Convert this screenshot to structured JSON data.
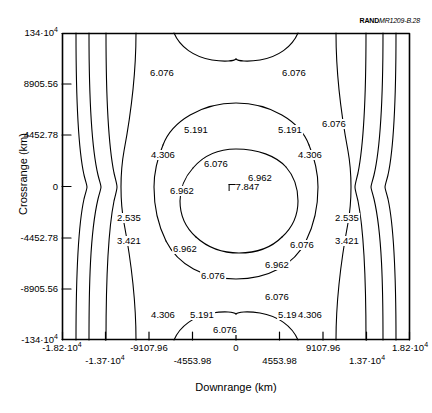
{
  "credit": {
    "publisher": "RAND",
    "document_id": "MR1209-B.28"
  },
  "axes": {
    "xlabel": "Downrange (km)",
    "ylabel": "Crossrange (km)"
  },
  "chart_data": {
    "type": "contour",
    "title": "",
    "xlabel": "Downrange (km)",
    "ylabel": "Crossrange (km)",
    "xlim": [
      -18200,
      18200
    ],
    "ylim": [
      -13400,
      13400
    ],
    "grid": false,
    "legend": "none",
    "xticks": [
      {
        "value": -18200,
        "label": "-1.82·10",
        "exp": "4",
        "row": "a"
      },
      {
        "value": -13700,
        "label": "-1.37·10",
        "exp": "4",
        "row": "b"
      },
      {
        "value": -9107.96,
        "label": "-9107.96",
        "exp": "",
        "row": "a"
      },
      {
        "value": -4553.98,
        "label": "-4553.98",
        "exp": "",
        "row": "b"
      },
      {
        "value": 0,
        "label": "0",
        "exp": "",
        "row": "a"
      },
      {
        "value": 4553.98,
        "label": "4553.98",
        "exp": "",
        "row": "b"
      },
      {
        "value": 9107.96,
        "label": "9107.96",
        "exp": "",
        "row": "a"
      },
      {
        "value": 13700,
        "label": "1.37·10",
        "exp": "4",
        "row": "b"
      },
      {
        "value": 18200,
        "label": "1.82·10",
        "exp": "4",
        "row": "a"
      }
    ],
    "yticks": [
      {
        "value": 13400,
        "label": "134·10",
        "exp": "4"
      },
      {
        "value": 8905.56,
        "label": "8905.56",
        "exp": ""
      },
      {
        "value": 4452.78,
        "label": "4452.78",
        "exp": ""
      },
      {
        "value": 0,
        "label": "0",
        "exp": ""
      },
      {
        "value": -4452.78,
        "label": "-4452.78",
        "exp": ""
      },
      {
        "value": -8905.56,
        "label": "-8905.56",
        "exp": ""
      },
      {
        "value": -13400,
        "label": "-134·10",
        "exp": "4"
      }
    ],
    "levels": [
      2.535,
      3.421,
      4.306,
      5.191,
      6.076,
      6.962
    ],
    "peak": {
      "value": 7.847,
      "label": "7.847",
      "x": 0,
      "y": 0
    },
    "contour_labels": [
      {
        "level": "6.076",
        "x": 100,
        "y": 40
      },
      {
        "level": "6.076",
        "x": 232,
        "y": 40
      },
      {
        "level": "5.191",
        "x": 134,
        "y": 97
      },
      {
        "level": "6.076",
        "x": 272,
        "y": 91
      },
      {
        "level": "5.191",
        "x": 228,
        "y": 97
      },
      {
        "level": "4.306",
        "x": 101,
        "y": 122
      },
      {
        "level": "6.076",
        "x": 154,
        "y": 131
      },
      {
        "level": "4.306",
        "x": 248,
        "y": 122
      },
      {
        "level": "6.962",
        "x": 198,
        "y": 145
      },
      {
        "level": "6.962",
        "x": 120,
        "y": 158
      },
      {
        "level": "2.535",
        "x": 67,
        "y": 185
      },
      {
        "level": "2.535",
        "x": 285,
        "y": 185
      },
      {
        "level": "3.421",
        "x": 67,
        "y": 208
      },
      {
        "level": "3.421",
        "x": 285,
        "y": 208
      },
      {
        "level": "6.962",
        "x": 123,
        "y": 216
      },
      {
        "level": "6.076",
        "x": 240,
        "y": 212
      },
      {
        "level": "6.962",
        "x": 215,
        "y": 232
      },
      {
        "level": "6.076",
        "x": 151,
        "y": 243
      },
      {
        "level": "6.076",
        "x": 215,
        "y": 264
      },
      {
        "level": "4.306",
        "x": 101,
        "y": 282
      },
      {
        "level": "5.191",
        "x": 140,
        "y": 282
      },
      {
        "level": "5.191",
        "x": 228,
        "y": 282
      },
      {
        "level": "4.306",
        "x": 248,
        "y": 282
      },
      {
        "level": "6.076",
        "x": 163,
        "y": 297
      }
    ]
  }
}
